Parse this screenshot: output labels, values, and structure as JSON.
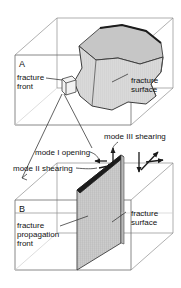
{
  "figure": {
    "background_color": "#ffffff",
    "line_color": "#555555",
    "bold_line_color": "#1a1a1a",
    "fill_color": "#d7d7d7",
    "text_color": "#111111"
  },
  "panel_a": {
    "letter": "A",
    "labels": {
      "fracture_front_line1": "fracture",
      "fracture_front_line2": "front",
      "fracture_surface_line1": "fracture",
      "fracture_surface_line2": "surface"
    }
  },
  "panel_b": {
    "letter": "B",
    "labels": {
      "fracture_propagation_front_line1": "fracture",
      "fracture_propagation_front_line2": "propagation",
      "fracture_propagation_front_line3": "front",
      "fracture_surface_line1": "fracture",
      "fracture_surface_line2": "surface"
    }
  },
  "modes": {
    "mode_i": "mode I opening",
    "mode_ii": "mode II shearing",
    "mode_iii": "mode III shearing"
  }
}
